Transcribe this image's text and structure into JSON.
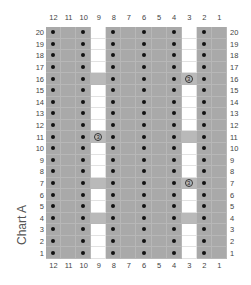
{
  "chart": {
    "title": "Chart A",
    "columns": [
      "12",
      "11",
      "10",
      "9",
      "8",
      "7",
      "6",
      "5",
      "4",
      "3",
      "2",
      "1"
    ],
    "rows": [
      "20",
      "19",
      "18",
      "17",
      "16",
      "15",
      "14",
      "13",
      "12",
      "11",
      "10",
      "9",
      "8",
      "7",
      "6",
      "5",
      "4",
      "3",
      "2",
      "1"
    ],
    "symbol_label": "3",
    "legend_colors": {
      "gray": "#a9a9a9",
      "light": "#b9b9b9",
      "white": "#ffffff",
      "dot": "#111111"
    }
  },
  "chart_data": {
    "type": "table",
    "title": "Chart A",
    "columns": [
      12,
      11,
      10,
      9,
      8,
      7,
      6,
      5,
      4,
      3,
      2,
      1
    ],
    "rows": [
      20,
      19,
      18,
      17,
      16,
      15,
      14,
      13,
      12,
      11,
      10,
      9,
      8,
      7,
      6,
      5,
      4,
      3,
      2,
      1
    ],
    "cell_types": {
      "D": "gray with dot (purl)",
      "G": "gray (knit)",
      "W": "white (no stitch)",
      "L": "light gray",
      "S": "light gray with circled 3 symbol"
    },
    "grid": [
      [
        "D",
        "G",
        "D",
        "W",
        "D",
        "G",
        "D",
        "G",
        "D",
        "W",
        "D",
        "G"
      ],
      [
        "D",
        "G",
        "D",
        "W",
        "D",
        "G",
        "D",
        "G",
        "D",
        "W",
        "D",
        "G"
      ],
      [
        "D",
        "G",
        "D",
        "W",
        "D",
        "G",
        "D",
        "G",
        "D",
        "W",
        "D",
        "G"
      ],
      [
        "D",
        "G",
        "D",
        "W",
        "D",
        "G",
        "D",
        "G",
        "D",
        "W",
        "D",
        "G"
      ],
      [
        "D",
        "G",
        "D",
        "L",
        "D",
        "G",
        "D",
        "G",
        "D",
        "S",
        "D",
        "G"
      ],
      [
        "D",
        "G",
        "D",
        "W",
        "D",
        "G",
        "D",
        "G",
        "D",
        "W",
        "D",
        "G"
      ],
      [
        "D",
        "G",
        "D",
        "W",
        "D",
        "G",
        "D",
        "G",
        "D",
        "W",
        "D",
        "G"
      ],
      [
        "D",
        "G",
        "D",
        "W",
        "D",
        "G",
        "D",
        "G",
        "D",
        "W",
        "D",
        "G"
      ],
      [
        "D",
        "G",
        "D",
        "W",
        "D",
        "G",
        "D",
        "G",
        "D",
        "W",
        "D",
        "G"
      ],
      [
        "D",
        "G",
        "D",
        "S",
        "D",
        "G",
        "D",
        "G",
        "D",
        "L",
        "D",
        "G"
      ],
      [
        "D",
        "G",
        "D",
        "W",
        "D",
        "G",
        "D",
        "G",
        "D",
        "W",
        "D",
        "G"
      ],
      [
        "D",
        "G",
        "D",
        "W",
        "D",
        "G",
        "D",
        "G",
        "D",
        "W",
        "D",
        "G"
      ],
      [
        "D",
        "G",
        "D",
        "W",
        "D",
        "G",
        "D",
        "G",
        "D",
        "W",
        "D",
        "G"
      ],
      [
        "D",
        "G",
        "D",
        "L",
        "D",
        "G",
        "D",
        "G",
        "D",
        "S",
        "D",
        "G"
      ],
      [
        "D",
        "G",
        "D",
        "W",
        "D",
        "G",
        "D",
        "G",
        "D",
        "W",
        "D",
        "G"
      ],
      [
        "D",
        "G",
        "D",
        "W",
        "D",
        "G",
        "D",
        "G",
        "D",
        "W",
        "D",
        "G"
      ],
      [
        "D",
        "G",
        "D",
        "L",
        "D",
        "G",
        "D",
        "G",
        "D",
        "L",
        "D",
        "G"
      ],
      [
        "D",
        "G",
        "D",
        "W",
        "D",
        "G",
        "D",
        "G",
        "D",
        "W",
        "D",
        "G"
      ],
      [
        "D",
        "G",
        "D",
        "W",
        "D",
        "G",
        "D",
        "G",
        "D",
        "W",
        "D",
        "G"
      ],
      [
        "D",
        "G",
        "D",
        "W",
        "D",
        "G",
        "D",
        "G",
        "D",
        "W",
        "D",
        "G"
      ]
    ]
  }
}
